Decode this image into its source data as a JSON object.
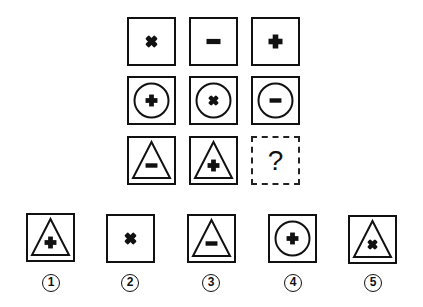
{
  "puzzle": {
    "grid": [
      [
        {
          "frame": "none",
          "symbol": "cross-x"
        },
        {
          "frame": "none",
          "symbol": "minus"
        },
        {
          "frame": "none",
          "symbol": "plus"
        }
      ],
      [
        {
          "frame": "circle",
          "symbol": "plus"
        },
        {
          "frame": "circle",
          "symbol": "cross-x"
        },
        {
          "frame": "circle",
          "symbol": "minus"
        }
      ],
      [
        {
          "frame": "triangle",
          "symbol": "minus"
        },
        {
          "frame": "triangle",
          "symbol": "plus"
        },
        {
          "frame": "unknown",
          "symbol": "question"
        }
      ]
    ],
    "question_mark": "?",
    "options": [
      {
        "label": "1",
        "frame": "triangle",
        "symbol": "plus"
      },
      {
        "label": "2",
        "frame": "none",
        "symbol": "cross-x"
      },
      {
        "label": "3",
        "frame": "triangle",
        "symbol": "minus"
      },
      {
        "label": "4",
        "frame": "circle",
        "symbol": "plus"
      },
      {
        "label": "5",
        "frame": "triangle",
        "symbol": "cross-x"
      }
    ]
  }
}
